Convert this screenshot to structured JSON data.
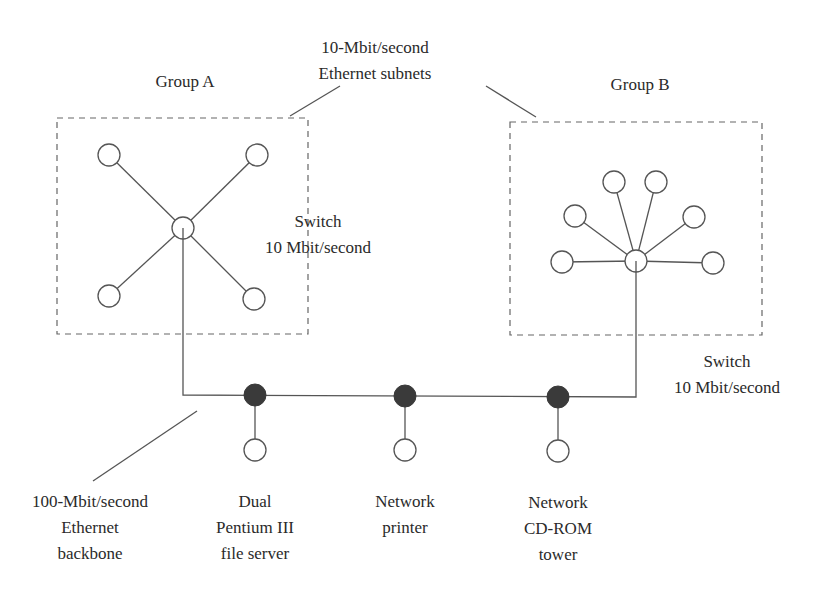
{
  "diagram": {
    "subnet_label": [
      "10-Mbit/second",
      "Ethernet subnets"
    ],
    "group_a": {
      "label": "Group A",
      "switch_label": [
        "Switch",
        "10 Mbit/second"
      ]
    },
    "group_b": {
      "label": "Group B",
      "switch_label": [
        "Switch",
        "10 Mbit/second"
      ]
    },
    "backbone_label": [
      "100-Mbit/second",
      "Ethernet",
      "backbone"
    ],
    "devices": [
      {
        "label": [
          "Dual",
          "Pentium III",
          "file server"
        ]
      },
      {
        "label": [
          "Network",
          "printer"
        ]
      },
      {
        "label": [
          "Network",
          "CD-ROM",
          "tower"
        ]
      }
    ],
    "colors": {
      "line": "#555555",
      "hub_fill": "#3a3a3a",
      "node_fill": "#ffffff",
      "text": "#2a2a2a"
    }
  }
}
